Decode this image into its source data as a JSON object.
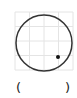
{
  "joystick": {
    "grid": {
      "x0": 15,
      "y0": 12,
      "size": 58,
      "divisions": 4,
      "line_color": "#e4e4e4"
    },
    "circle": {
      "cx": 44,
      "cy": 43,
      "r": 28,
      "stroke": "#333333",
      "stroke_width": 1.5
    },
    "point": {
      "cx": 58,
      "cy": 57,
      "r": 2,
      "fill": "#111111"
    }
  },
  "value_label": {
    "open": "(",
    "value": "",
    "close": ")"
  }
}
